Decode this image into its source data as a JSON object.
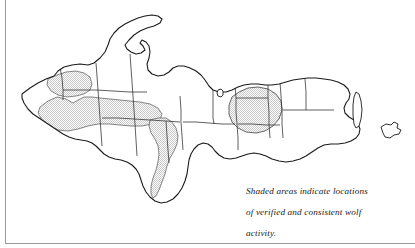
{
  "figure": {
    "kind": "map",
    "region_title": "Michigan Upper Peninsula",
    "caption_lines": [
      "Shaded areas indicate locations",
      "of verified and consistent wolf",
      "activity."
    ],
    "caption_full": "Shaded areas indicate locations of verified and consistent wolf activity."
  },
  "legend": {
    "shaded_meaning": "verified and consistent wolf activity"
  },
  "style": {
    "background_color": "#ffffff",
    "outline_color": "#1a1a1a",
    "county_line_color": "#2b2b2b",
    "shade_fill_color": "#d9d9d9",
    "shade_pattern": "stipple",
    "frame_color": "#9a9a9a"
  },
  "map": {
    "coastline_path": "M 22 94 L 30 88 L 38 83 L 46 79 L 54 76 L 58 71 L 64 67 L 72 65 L 80 64 L 88 65 L 94 63 L 100 58 L 105 52 L 108 45 L 110 39 L 114 33 L 119 28 L 125 24 L 131 21 L 138 18 L 145 16 L 152 15 L 158 16 L 162 19 L 160 23 L 154 26 L 147 28 L 140 31 L 134 35 L 129 40 L 125 45 L 127 49 L 131 52 L 136 54 L 141 53 L 145 50 L 143 46 L 140 43 L 142 40 L 146 42 L 149 46 L 150 52 L 149 58 L 147 64 L 148 70 L 152 74 L 158 76 L 164 75 L 169 72 L 173 68 L 178 66 L 184 66 L 190 68 L 196 71 L 201 75 L 205 80 L 209 86 L 213 90 L 219 92 L 226 92 L 232 90 L 238 87 L 244 85 L 251 84 L 258 84 L 265 85 L 272 85 L 279 84 L 286 82 L 293 80 L 300 79 L 308 78 L 316 78 L 324 79 L 331 80 L 338 82 L 344 85 L 348 89 L 350 94 L 349 99 L 346 103 L 344 108 L 345 113 L 349 117 L 354 120 L 358 124 L 360 129 L 359 134 L 356 138 L 351 141 L 345 143 L 338 144 L 331 144 L 324 145 L 318 148 L 312 152 L 306 156 L 300 159 L 293 161 L 286 162 L 279 161 L 272 159 L 266 156 L 260 154 L 254 153 L 248 154 L 242 156 L 236 158 L 230 159 L 224 158 L 219 155 L 215 151 L 212 147 L 208 144 L 203 143 L 198 145 L 194 149 L 191 154 L 189 160 L 188 167 L 187 174 L 185 181 L 182 188 L 178 194 L 173 199 L 167 202 L 161 203 L 155 201 L 150 197 L 146 192 L 143 186 L 141 180 L 139 174 L 136 169 L 132 165 L 127 162 L 121 160 L 115 159 L 109 157 L 104 154 L 100 150 L 96 146 L 92 143 L 87 141 L 81 140 L 75 139 L 69 137 L 63 134 L 57 130 L 51 126 L 45 122 L 39 118 L 33 114 L 28 109 L 24 103 L 22 98 Z",
    "county_lines": [
      "M 60 67 L 62 78 L 63 90 L 63 100",
      "M 96 63 L 97 76 L 98 90 L 99 104 L 100 118 L 101 132 L 102 146",
      "M 63 90 L 80 90 L 96 90 L 113 91 L 130 92 L 147 92",
      "M 130 54 L 131 68 L 132 82 L 133 96 L 134 110 L 135 124 L 136 140 L 137 156",
      "M 102 118 L 118 118 L 134 119 L 150 120 L 166 121 L 180 122",
      "M 166 121 L 167 136 L 168 150 L 169 163",
      "M 180 96 L 181 110 L 181 122 L 182 136 L 183 150",
      "M 183 122 L 196 122 L 209 123 L 222 124 L 235 124",
      "M 213 90 L 213 104 L 213 118 L 214 124",
      "M 235 84 L 236 98 L 236 112 L 237 124 L 238 138 L 238 150",
      "M 238 124 L 252 124 L 266 125 L 280 125",
      "M 268 85 L 268 98 L 269 112 L 269 124 L 270 138",
      "M 280 82 L 281 96 L 282 110 L 282 124 L 283 138",
      "M 283 110 L 296 110 L 309 110 L 322 110 L 334 110",
      "M 305 79 L 306 92 L 306 105 L 306 110",
      "M 236 98 L 250 98 L 262 98 L 268 98"
    ],
    "shaded_regions": [
      {
        "name": "gogebic-ontonagon-north",
        "path": "M 48 79 L 57 75 L 66 72 L 76 71 L 84 73 L 90 77 L 92 84 L 90 90 L 84 94 L 76 96 L 67 97 L 58 95 L 51 91 L 47 85 Z"
      },
      {
        "name": "iron-ontonagon-baraga-belt",
        "path": "M 40 107 L 48 101 L 57 97 L 66 99 L 73 103 L 78 100 L 84 97 L 92 97 L 100 98 L 110 99 L 120 100 L 130 101 L 140 102 L 150 104 L 158 108 L 162 114 L 160 120 L 152 124 L 142 126 L 131 126 L 120 125 L 109 124 L 98 124 L 88 126 L 78 129 L 68 131 L 58 130 L 49 126 L 42 120 L 38 113 Z"
      },
      {
        "name": "dickinson-menominee-strip",
        "path": "M 150 120 L 158 118 L 166 118 L 172 122 L 176 128 L 178 136 L 177 144 L 174 151 L 170 158 L 167 166 L 165 174 L 162 182 L 159 190 L 156 196 L 153 198 L 151 194 L 151 186 L 153 178 L 156 170 L 158 162 L 159 154 L 158 146 L 155 139 L 151 133 L 149 126 Z"
      },
      {
        "name": "marquette-alger-blob",
        "path": "M 239 92 L 248 88 L 258 87 L 268 89 L 276 94 L 281 101 L 282 110 L 279 119 L 273 126 L 265 131 L 256 133 L 246 132 L 238 128 L 232 122 L 229 114 L 229 105 L 232 97 Z"
      }
    ],
    "islands": [
      {
        "name": "grand-island",
        "path": "M 218 90 L 221 89 L 223 91 L 223 95 L 221 97 L 218 96 L 217 93 Z"
      },
      {
        "name": "drummond-island",
        "path": "M 381 127 L 386 124 L 391 125 L 394 122 L 398 124 L 397 128 L 401 130 L 399 134 L 394 135 L 390 138 L 385 137 L 383 133 Z"
      },
      {
        "name": "sugar-island",
        "path": "M 356 92 L 359 94 L 361 101 L 362 110 L 361 119 L 359 126 L 356 128 L 354 124 L 353 115 L 353 105 L 354 97 Z"
      }
    ]
  }
}
